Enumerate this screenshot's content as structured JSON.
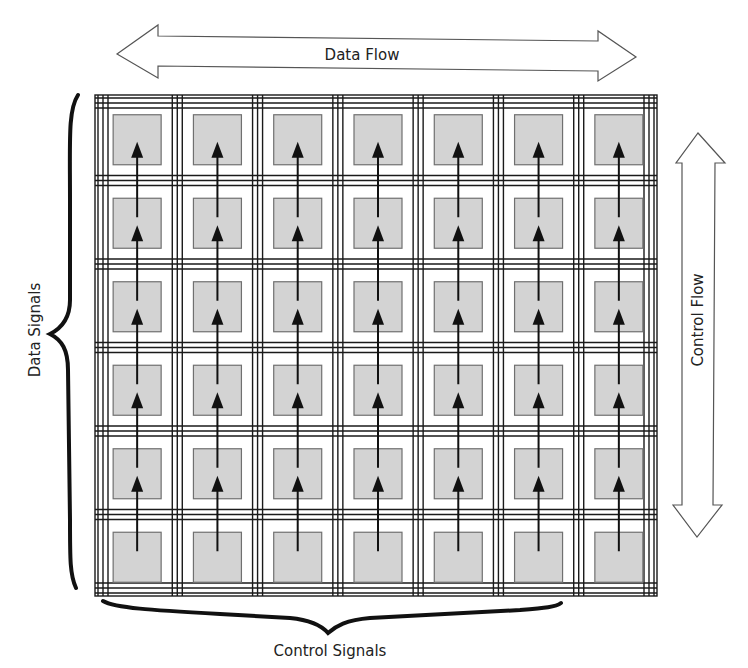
{
  "diagram": {
    "type": "systolic-array",
    "rows": 6,
    "cols": 7,
    "labels": {
      "top_arrow": "Data Flow",
      "right_arrow": "Control Flow",
      "left_brace": "Data Signals",
      "bottom_brace": "Control Signals"
    },
    "colors": {
      "cell_fill": "#d3d3d3",
      "cell_border": "#707070",
      "grid_line": "#1a1a1a",
      "arrow_outline": "#555555",
      "brace": "#111111"
    },
    "cell_arrows": "vertical upward arrows connecting each cell to the cell above in every column"
  }
}
